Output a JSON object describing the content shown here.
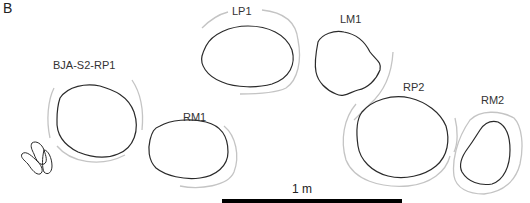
{
  "figure": {
    "panel_label": "B",
    "features": [
      {
        "id": "BJA-S2-RP1",
        "label": "BJA-S2-RP1",
        "type": "post-hole"
      },
      {
        "id": "RM1",
        "label": "RM1",
        "type": "post-hole"
      },
      {
        "id": "LP1",
        "label": "LP1",
        "type": "post-hole"
      },
      {
        "id": "LM1",
        "label": "LM1",
        "type": "post-hole"
      },
      {
        "id": "RP2",
        "label": "RP2",
        "type": "post-hole"
      },
      {
        "id": "RM2",
        "label": "RM2",
        "type": "post-hole"
      }
    ],
    "scale_bar": {
      "label": "1 m"
    },
    "colors": {
      "outline": "#2a2a2a",
      "halo": "#bdbdbd",
      "scale_bar": "#000000"
    }
  }
}
